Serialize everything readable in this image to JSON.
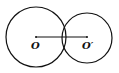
{
  "diagram": {
    "stroke_color": "#111111",
    "circles": [
      {
        "name": "circle-O",
        "cx": 36,
        "cy": 37,
        "r": 30
      },
      {
        "name": "circle-O-prime",
        "cx": 87,
        "cy": 38,
        "r": 25
      }
    ],
    "segment": {
      "x1": 36,
      "y1": 37,
      "x2": 87,
      "y2": 37
    },
    "labels": {
      "center_left": "O",
      "center_right": "O′"
    }
  }
}
